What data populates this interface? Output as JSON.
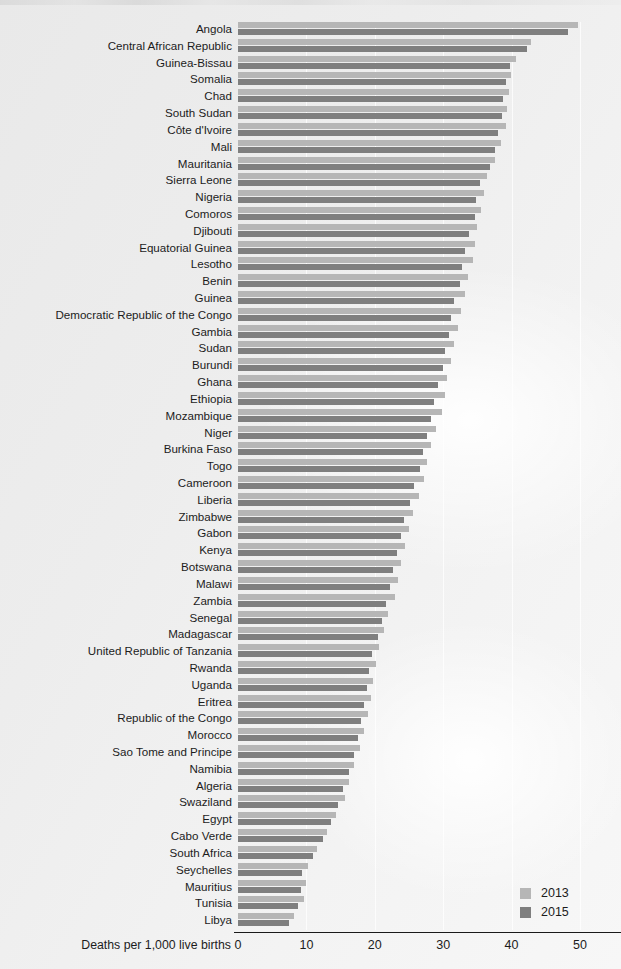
{
  "chart_data": {
    "type": "bar",
    "orientation": "horizontal",
    "title": "",
    "xlabel": "Deaths per 1,000 live births",
    "ylabel": "",
    "xlim": [
      0,
      56
    ],
    "xticks": [
      0,
      10,
      20,
      30,
      40,
      50
    ],
    "grid": true,
    "legend_position": "bottom-right",
    "categories": [
      "Angola",
      "Central African Republic",
      "Guinea-Bissau",
      "Somalia",
      "Chad",
      "South Sudan",
      "Côte d'Ivoire",
      "Mali",
      "Mauritania",
      "Sierra Leone",
      "Nigeria",
      "Comoros",
      "Djibouti",
      "Equatorial Guinea",
      "Lesotho",
      "Benin",
      "Guinea",
      "Democratic Republic of the Congo",
      "Gambia",
      "Sudan",
      "Burundi",
      "Ghana",
      "Ethiopia",
      "Mozambique",
      "Niger",
      "Burkina Faso",
      "Togo",
      "Cameroon",
      "Liberia",
      "Zimbabwe",
      "Gabon",
      "Kenya",
      "Botswana",
      "Malawi",
      "Zambia",
      "Senegal",
      "Madagascar",
      "United Republic of Tanzania",
      "Rwanda",
      "Uganda",
      "Eritrea",
      "Republic of the Congo",
      "Morocco",
      "Sao Tome and Principe",
      "Namibia",
      "Algeria",
      "Swaziland",
      "Egypt",
      "Cabo Verde",
      "South Africa",
      "Seychelles",
      "Mauritius",
      "Tunisia",
      "Libya"
    ],
    "series": [
      {
        "name": "2013",
        "color": "#b6b6b6",
        "values": [
          49.7,
          42.8,
          40.6,
          39.9,
          39.6,
          39.4,
          39.2,
          38.4,
          37.6,
          36.4,
          36.0,
          35.6,
          35.0,
          34.6,
          34.4,
          33.6,
          33.2,
          32.6,
          32.2,
          31.6,
          31.2,
          30.6,
          30.2,
          29.8,
          29.0,
          28.2,
          27.6,
          27.2,
          26.4,
          25.6,
          25.0,
          24.4,
          23.8,
          23.4,
          23.0,
          22.0,
          21.4,
          20.6,
          20.2,
          19.8,
          19.4,
          19.0,
          18.4,
          17.8,
          17.0,
          16.2,
          15.6,
          14.4,
          13.0,
          11.6,
          10.2,
          10.0,
          9.6,
          8.2
        ]
      },
      {
        "name": "2015",
        "color": "#7f7f7f",
        "values": [
          48.2,
          42.2,
          39.8,
          39.2,
          38.8,
          38.6,
          38.0,
          37.6,
          36.8,
          35.4,
          34.8,
          34.6,
          33.8,
          33.2,
          32.8,
          32.4,
          31.6,
          31.2,
          30.8,
          30.2,
          30.0,
          29.2,
          28.6,
          28.2,
          27.6,
          27.0,
          26.6,
          25.8,
          25.2,
          24.2,
          23.8,
          23.2,
          22.6,
          22.2,
          21.6,
          21.0,
          20.4,
          19.6,
          19.2,
          18.8,
          18.4,
          18.0,
          17.6,
          17.0,
          16.2,
          15.4,
          14.6,
          13.6,
          12.4,
          11.0,
          9.4,
          9.2,
          8.8,
          7.4
        ]
      }
    ]
  },
  "axis": {
    "title": "Deaths per 1,000 live births",
    "tick_labels": [
      "0",
      "10",
      "20",
      "30",
      "40",
      "50"
    ]
  },
  "legend": {
    "items": [
      {
        "label": "2013",
        "color": "#b6b6b6"
      },
      {
        "label": "2015",
        "color": "#7f7f7f"
      }
    ]
  }
}
